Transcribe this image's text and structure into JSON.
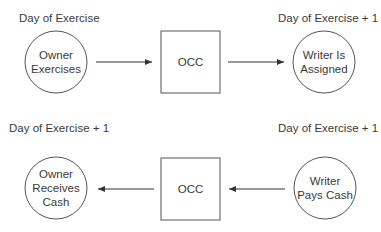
{
  "colors": {
    "stroke": "#555555",
    "text": "#3a3a3a",
    "background": "#ffffff"
  },
  "top_row": {
    "label_left": "Day of Exercise",
    "label_right": "Day of Exercise + 1",
    "node_left": {
      "shape": "circle",
      "lines": [
        "Owner",
        "Exercises"
      ]
    },
    "node_middle": {
      "shape": "box",
      "text": "OCC"
    },
    "node_right": {
      "shape": "circle",
      "lines": [
        "Writer Is",
        "Assigned"
      ]
    },
    "arrow_direction": "right"
  },
  "bottom_row": {
    "label_left": "Day of Exercise + 1",
    "label_right": "Day of Exercise + 1",
    "node_left": {
      "shape": "circle",
      "lines": [
        "Owner",
        "Receives",
        "Cash"
      ]
    },
    "node_middle": {
      "shape": "box",
      "text": "OCC"
    },
    "node_right": {
      "shape": "circle",
      "lines": [
        "Writer",
        "Pays Cash"
      ]
    },
    "arrow_direction": "left"
  }
}
